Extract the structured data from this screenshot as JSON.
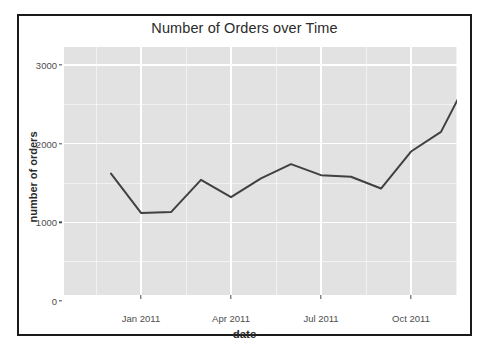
{
  "figure": {
    "title": "Number of Orders over Time",
    "panel_background": "#e2e2e2",
    "grid_color": "#ffffff",
    "line_color": "#404040",
    "frame_color": "#1a1a1a"
  },
  "axes": {
    "y": {
      "title": "number of orders",
      "ticks": [
        "0",
        "1000",
        "2000",
        "3000"
      ],
      "tick_values": [
        0,
        1000,
        2000,
        3000
      ],
      "limits": [
        -120,
        3060
      ]
    },
    "x": {
      "title": "date",
      "ticks": [
        "Jan 2011",
        "Apr 2011",
        "Jul 2011",
        "Oct 2011"
      ],
      "tick_values": [
        "2011-01",
        "2011-04",
        "2011-07",
        "2011-10"
      ],
      "limits": [
        "2010-12",
        "2011-12"
      ]
    }
  },
  "chart_data": {
    "type": "line",
    "title": "Number of Orders over Time",
    "xlabel": "date",
    "ylabel": "number of orders",
    "xlim": [
      "2010-12",
      "2011-12"
    ],
    "ylim": [
      0,
      3000
    ],
    "yticks": [
      0,
      1000,
      2000,
      3000
    ],
    "xticks": [
      "Jan 2011",
      "Apr 2011",
      "Jul 2011",
      "Oct 2011"
    ],
    "grid": true,
    "legend": "none",
    "x": [
      "Dec 2010",
      "Jan 2011",
      "Feb 2011",
      "Mar 2011",
      "Apr 2011",
      "May 2011",
      "Jun 2011",
      "Jul 2011",
      "Aug 2011",
      "Sep 2011",
      "Oct 2011",
      "Nov 2011",
      "Dec 2011"
    ],
    "series": [
      {
        "name": "number of orders",
        "color": "#404040",
        "values": [
          1620,
          1120,
          1130,
          1540,
          1320,
          1560,
          1740,
          1600,
          1580,
          1430,
          1900,
          2150,
          2890
        ]
      }
    ]
  }
}
